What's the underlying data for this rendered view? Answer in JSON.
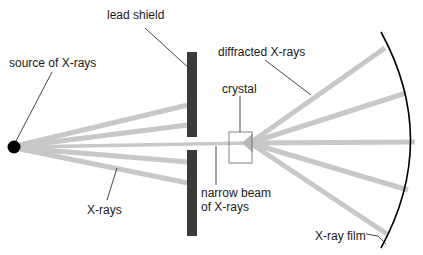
{
  "diagram": {
    "labels": {
      "source": "source of X-rays",
      "lead_shield": "lead shield",
      "diffracted": "diffracted X-rays",
      "crystal": "crystal",
      "xrays": "X-rays",
      "narrow_beam_line1": "narrow beam",
      "narrow_beam_line2": "of X-rays",
      "film": "X-ray film"
    },
    "colors": {
      "beam": "#c8c8c8",
      "shield": "#3a3a3a",
      "source": "#000000",
      "film": "#000000",
      "crystal_outline": "#777777"
    }
  }
}
